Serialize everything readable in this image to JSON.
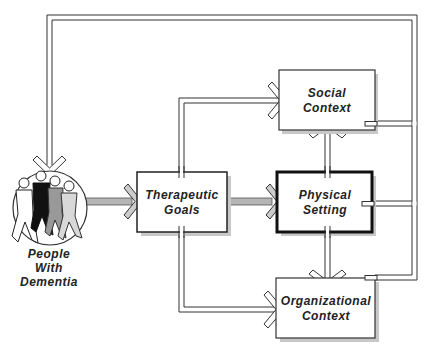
{
  "diagram": {
    "nodes": {
      "people": {
        "line1": "People",
        "line2": "With",
        "line3": "Dementia"
      },
      "therapeutic_goals": {
        "line1": "Therapeutic",
        "line2": "Goals"
      },
      "physical_setting": {
        "line1": "Physical",
        "line2": "Setting"
      },
      "social_context": {
        "line1": "Social",
        "line2": "Context"
      },
      "organizational_context": {
        "line1": "Organizational",
        "line2": "Context"
      }
    },
    "edges": [
      {
        "from": "People With Dementia",
        "to": "Therapeutic Goals"
      },
      {
        "from": "Therapeutic Goals",
        "to": "Physical Setting"
      },
      {
        "from": "Therapeutic Goals",
        "to": "Social Context"
      },
      {
        "from": "Therapeutic Goals",
        "to": "Organizational Context"
      },
      {
        "from": "Physical Setting",
        "to": "Social Context"
      },
      {
        "from": "Physical Setting",
        "to": "Organizational Context"
      },
      {
        "from": "Social Context",
        "to": "People With Dementia"
      },
      {
        "from": "Physical Setting",
        "to": "People With Dementia"
      },
      {
        "from": "Organizational Context",
        "to": "People With Dementia"
      }
    ],
    "colors": {
      "stroke": "#333333",
      "shadow": "#bbbbbb",
      "gray_arrow": "#aaaaaa"
    }
  }
}
